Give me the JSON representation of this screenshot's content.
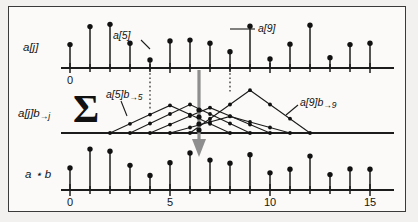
{
  "figure": {
    "background": "#fbfaf8",
    "border_color": "#3a3a3a",
    "ink_color": "#1c1c1c",
    "arrow_color": "#8e8e8e"
  },
  "row_labels": {
    "top": "a[j]",
    "middle_main": "a[j]b",
    "middle_sub": "→j",
    "bottom": "a ⋆ b"
  },
  "operator": {
    "sigma": "Σ"
  },
  "annotations": {
    "a5": "a[5]",
    "a9": "a[9]",
    "kernel5_main": "a[5]b",
    "kernel5_sub": "→5",
    "kernel9_main": "a[9]b",
    "kernel9_sub": "→9"
  },
  "axes": {
    "top_tick_labels": [
      "0"
    ],
    "top_tick_values": [
      0
    ],
    "bottom_tick_labels": [
      "0",
      "5",
      "10",
      "15"
    ],
    "bottom_tick_values": [
      0,
      5,
      10,
      15
    ],
    "index_min": 0,
    "index_max": 16,
    "highlight_indices": [
      5,
      9
    ],
    "sum_index": 7
  },
  "chart_data": {
    "type": "bar",
    "xlabel": "j",
    "ylabel": "",
    "grid": false,
    "legend": "none",
    "xlim": [
      0,
      16
    ],
    "series": [
      {
        "name": "a[j]",
        "panel": "top",
        "categories": [
          0,
          1,
          2,
          3,
          4,
          5,
          6,
          7,
          8,
          9,
          10,
          11,
          12,
          13,
          14,
          15,
          16
        ],
        "values": [
          0.52,
          0.92,
          0.97,
          0.55,
          0.18,
          0.6,
          0.62,
          0.55,
          0.36,
          0.93,
          0.2,
          0.53,
          0.95,
          0.23,
          0.52,
          0.55,
          0.0
        ]
      },
      {
        "name": "a ⋆ b",
        "panel": "bottom",
        "categories": [
          0,
          1,
          2,
          3,
          4,
          5,
          6,
          7,
          8,
          9,
          10,
          11,
          12,
          13,
          14,
          15,
          16
        ],
        "values": [
          0.5,
          0.93,
          0.88,
          0.56,
          0.33,
          0.62,
          0.84,
          0.68,
          0.61,
          0.8,
          0.39,
          0.47,
          0.77,
          0.35,
          0.48,
          0.47,
          0.0
        ]
      }
    ],
    "kernels": {
      "name": "a[j]b→j",
      "panel": "middle",
      "shape": "triangular",
      "half_width": 3,
      "centers": [
        5,
        6,
        7,
        8,
        9
      ],
      "peaks": [
        0.6,
        0.62,
        0.55,
        0.36,
        0.93
      ]
    }
  }
}
